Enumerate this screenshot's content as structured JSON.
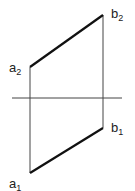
{
  "diagram": {
    "type": "orthographic-projection",
    "reference_line": {
      "x1": 12,
      "y1": 98,
      "x2": 122,
      "y2": 98
    },
    "points": {
      "a2": {
        "x": 30,
        "y": 67
      },
      "b2": {
        "x": 103,
        "y": 15
      },
      "a1": {
        "x": 30,
        "y": 173
      },
      "b1": {
        "x": 103,
        "y": 128
      }
    },
    "labels": [
      {
        "id": "a2",
        "base": "a",
        "sub": "2"
      },
      {
        "id": "b2",
        "base": "b",
        "sub": "2"
      },
      {
        "id": "b1",
        "base": "b",
        "sub": "1"
      },
      {
        "id": "a1",
        "base": "a",
        "sub": "1"
      }
    ],
    "colors": {
      "line": "#333333",
      "segment": "#111111",
      "background": "#ffffff"
    }
  }
}
